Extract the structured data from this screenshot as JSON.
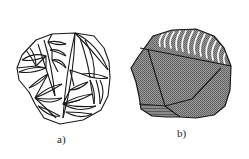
{
  "figure": {
    "panels": [
      {
        "id": "a",
        "label": "a)",
        "description": "Polygonal grain outline subdivided into lens-shaped (lenticular) segments"
      },
      {
        "id": "b",
        "label": "b)",
        "description": "Polygonal grain with shaded facets; top facet shows white arc striations, bottom strip shows horizontal banding"
      }
    ],
    "colors": {
      "ink": "#1a1a1a",
      "shade": "#8c8c8c",
      "shade_dark": "#6e6e6e",
      "background": "#ffffff"
    }
  }
}
